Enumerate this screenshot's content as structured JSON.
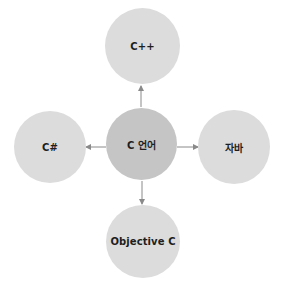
{
  "diagram": {
    "type": "hub-and-spoke",
    "center": {
      "label": "C 언어",
      "color": "#c5c5c5"
    },
    "nodes": [
      {
        "id": "top",
        "label": "C++",
        "color": "#dcdcdc"
      },
      {
        "id": "left",
        "label": "C#",
        "color": "#dcdcdc"
      },
      {
        "id": "right",
        "label": "자바",
        "color": "#dcdcdc"
      },
      {
        "id": "bottom",
        "label": "Objective C",
        "color": "#dcdcdc"
      }
    ],
    "edges": [
      {
        "from": "C 언어",
        "to": "C++"
      },
      {
        "from": "C 언어",
        "to": "C#"
      },
      {
        "from": "C 언어",
        "to": "자바"
      },
      {
        "from": "C 언어",
        "to": "Objective C"
      }
    ],
    "arrow_color": "#8a8a8a"
  }
}
